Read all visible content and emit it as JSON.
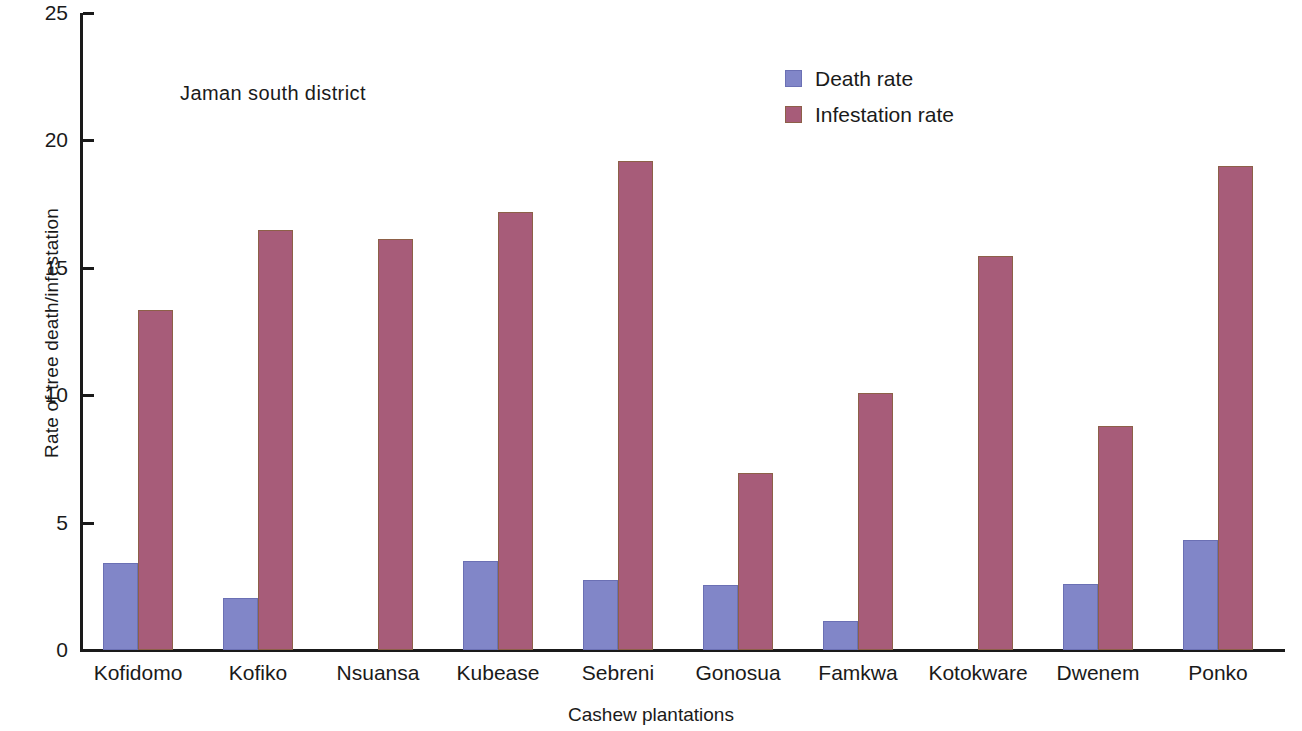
{
  "chart_data": {
    "type": "bar",
    "title": "",
    "annotation": "Jaman south district",
    "xlabel": "Cashew plantations",
    "ylabel": "Rate of tree death/infestation",
    "ylim": [
      0,
      25
    ],
    "yticks": [
      0,
      5,
      10,
      15,
      20,
      25
    ],
    "ytick_labels": [
      "0",
      "5",
      "10",
      "15",
      "20",
      "25"
    ],
    "grid": false,
    "legend_position": "top-right",
    "categories": [
      "Kofidomo",
      "Kofiko",
      "Nsuansa",
      "Kubease",
      "Sebreni",
      "Gonosua",
      "Famkwa",
      "Kotokware",
      "Dwenem",
      "Ponko"
    ],
    "series": [
      {
        "name": "Death rate",
        "color": "#8186c8",
        "values": [
          3.4,
          2.05,
          0,
          3.5,
          2.75,
          2.55,
          1.15,
          0,
          2.6,
          4.3
        ]
      },
      {
        "name": "Infestation rate",
        "color": "#a75c79",
        "values": [
          13.35,
          16.5,
          16.15,
          17.2,
          19.2,
          6.95,
          10.1,
          15.45,
          8.8,
          19.0
        ]
      }
    ]
  },
  "legend": {
    "items": [
      {
        "label": "Death rate",
        "key": "death"
      },
      {
        "label": "Infestation rate",
        "key": "infestation"
      }
    ]
  }
}
